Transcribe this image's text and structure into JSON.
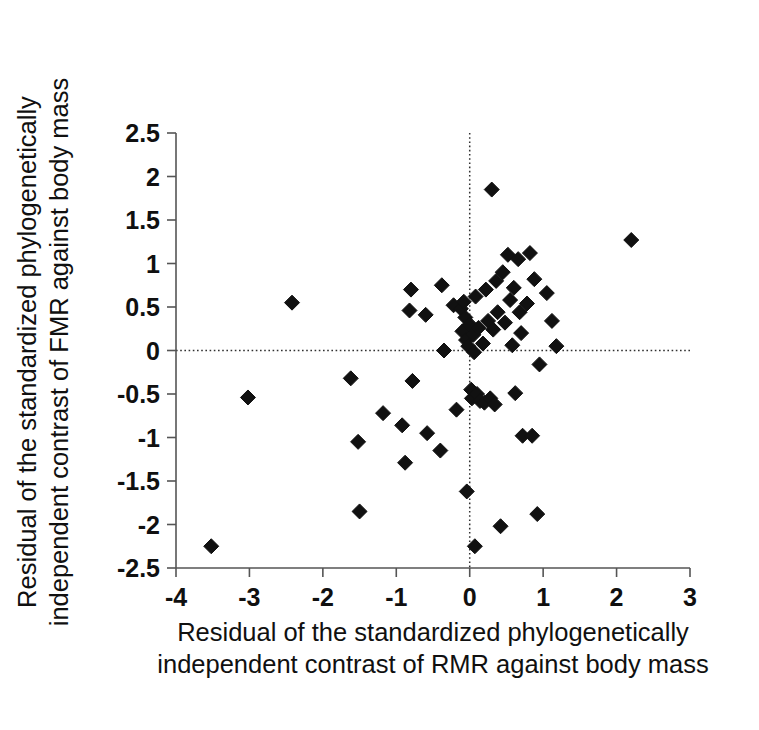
{
  "figure": {
    "background_color": "#ffffff",
    "marker_color": "#111111",
    "axis_color": "#555555",
    "reference_line_color": "#303030"
  },
  "axes": {
    "x_title_line1": "Residual of the standardized phylogenetically",
    "x_title_line2": "independent contrast of RMR against body mass",
    "y_title_line1": "Residual of the standardized phylogenetically",
    "y_title_line2": "independent contrast of FMR against body mass",
    "x_ticks": [
      "-4",
      "-3",
      "-2",
      "-1",
      "0",
      "1",
      "2",
      "3"
    ],
    "y_ticks": [
      "2.5",
      "2",
      "1.5",
      "1",
      "0.5",
      "0",
      "-0.5",
      "-1",
      "-1.5",
      "-2",
      "-2.5"
    ]
  },
  "chart_data": {
    "type": "scatter",
    "title": "",
    "xlabel": "Residual of the standardized phylogenetically independent contrast of RMR against body mass",
    "ylabel": "Residual of the standardized phylogenetically independent contrast of FMR against body mass",
    "xlim": [
      -4,
      3
    ],
    "ylim": [
      -2.5,
      2.5
    ],
    "xticks": [
      -4,
      -3,
      -2,
      -1,
      0,
      1,
      2,
      3
    ],
    "yticks": [
      -2.5,
      -2,
      -1.5,
      -1,
      -0.5,
      0,
      0.5,
      1,
      1.5,
      2,
      2.5
    ],
    "grid": false,
    "legend": null,
    "marker": "diamond",
    "reference_lines": [
      {
        "orientation": "horizontal",
        "value": 0,
        "style": "dotted"
      },
      {
        "orientation": "vertical",
        "value": 0,
        "style": "dotted"
      }
    ],
    "points": [
      [
        -3.52,
        -2.25
      ],
      [
        -3.02,
        -0.54
      ],
      [
        -2.42,
        0.55
      ],
      [
        -1.62,
        -0.32
      ],
      [
        -1.52,
        -1.05
      ],
      [
        -1.5,
        -1.85
      ],
      [
        -1.18,
        -0.72
      ],
      [
        -0.92,
        -0.86
      ],
      [
        -0.88,
        -1.29
      ],
      [
        -0.82,
        0.46
      ],
      [
        -0.8,
        0.7
      ],
      [
        -0.78,
        -0.35
      ],
      [
        -0.6,
        0.41
      ],
      [
        -0.58,
        -0.95
      ],
      [
        -0.4,
        -1.15
      ],
      [
        -0.38,
        0.75
      ],
      [
        -0.35,
        0.0
      ],
      [
        -0.22,
        0.52
      ],
      [
        -0.18,
        -0.68
      ],
      [
        -0.12,
        0.48
      ],
      [
        -0.1,
        0.22
      ],
      [
        -0.08,
        0.56
      ],
      [
        -0.06,
        0.38
      ],
      [
        -0.05,
        0.12
      ],
      [
        -0.04,
        -1.62
      ],
      [
        -0.02,
        0.05
      ],
      [
        0.0,
        0.3
      ],
      [
        0.02,
        -0.45
      ],
      [
        0.03,
        -0.55
      ],
      [
        0.05,
        0.18
      ],
      [
        0.06,
        -0.02
      ],
      [
        0.07,
        -2.25
      ],
      [
        0.08,
        0.62
      ],
      [
        0.1,
        -0.5
      ],
      [
        0.12,
        0.26
      ],
      [
        0.14,
        -0.58
      ],
      [
        0.18,
        0.08
      ],
      [
        0.2,
        -0.6
      ],
      [
        0.22,
        0.7
      ],
      [
        0.25,
        0.34
      ],
      [
        0.28,
        -0.55
      ],
      [
        0.3,
        1.85
      ],
      [
        0.32,
        0.24
      ],
      [
        0.34,
        -0.62
      ],
      [
        0.36,
        0.8
      ],
      [
        0.38,
        0.44
      ],
      [
        0.42,
        -2.02
      ],
      [
        0.45,
        0.9
      ],
      [
        0.48,
        0.32
      ],
      [
        0.52,
        1.1
      ],
      [
        0.55,
        0.58
      ],
      [
        0.58,
        0.06
      ],
      [
        0.6,
        0.72
      ],
      [
        0.62,
        -0.49
      ],
      [
        0.66,
        1.05
      ],
      [
        0.68,
        0.44
      ],
      [
        0.7,
        0.2
      ],
      [
        0.72,
        -0.98
      ],
      [
        0.78,
        0.54
      ],
      [
        0.82,
        1.12
      ],
      [
        0.85,
        -0.98
      ],
      [
        0.88,
        0.82
      ],
      [
        0.92,
        -1.88
      ],
      [
        0.95,
        -0.16
      ],
      [
        1.05,
        0.66
      ],
      [
        1.12,
        0.34
      ],
      [
        1.18,
        0.05
      ],
      [
        2.2,
        1.27
      ]
    ]
  }
}
